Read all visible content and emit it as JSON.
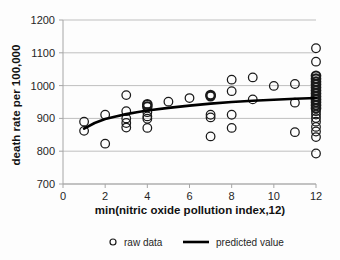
{
  "chart_data": {
    "type": "scatter",
    "title": "",
    "xlabel": "min(nitric oxide pollution index,12)",
    "ylabel": "death rate per 100,000",
    "xlim": [
      0,
      12
    ],
    "ylim": [
      700,
      1200
    ],
    "xticks": [
      0,
      2,
      4,
      6,
      8,
      10,
      12
    ],
    "yticks": [
      700,
      800,
      900,
      1000,
      1100,
      1200
    ],
    "grid": "horizontal",
    "legend_position": "bottom",
    "legend": [
      {
        "label": "raw data",
        "marker": "open-circle"
      },
      {
        "label": "predicted value",
        "marker": "line"
      }
    ],
    "series": [
      {
        "name": "raw data",
        "marker": "open-circle",
        "points": [
          {
            "x": 1,
            "y": 890
          },
          {
            "x": 1,
            "y": 862
          },
          {
            "x": 2,
            "y": 911
          },
          {
            "x": 2,
            "y": 823
          },
          {
            "x": 3,
            "y": 971
          },
          {
            "x": 3,
            "y": 922
          },
          {
            "x": 3,
            "y": 900
          },
          {
            "x": 3,
            "y": 886
          },
          {
            "x": 3,
            "y": 872
          },
          {
            "x": 4,
            "y": 943,
            "emphasis": true
          },
          {
            "x": 4,
            "y": 936,
            "emphasis": true
          },
          {
            "x": 4,
            "y": 919
          },
          {
            "x": 4,
            "y": 906
          },
          {
            "x": 4,
            "y": 899
          },
          {
            "x": 4,
            "y": 871
          },
          {
            "x": 5,
            "y": 951
          },
          {
            "x": 6,
            "y": 962
          },
          {
            "x": 7,
            "y": 971,
            "emphasis": true
          },
          {
            "x": 7,
            "y": 968,
            "emphasis": true
          },
          {
            "x": 7,
            "y": 911
          },
          {
            "x": 7,
            "y": 903
          },
          {
            "x": 7,
            "y": 845
          },
          {
            "x": 8,
            "y": 1018
          },
          {
            "x": 8,
            "y": 983
          },
          {
            "x": 8,
            "y": 911
          },
          {
            "x": 8,
            "y": 871
          },
          {
            "x": 9,
            "y": 1025
          },
          {
            "x": 9,
            "y": 958
          },
          {
            "x": 10,
            "y": 999
          },
          {
            "x": 11,
            "y": 1005
          },
          {
            "x": 11,
            "y": 948
          },
          {
            "x": 11,
            "y": 858
          },
          {
            "x": 12,
            "y": 1114
          },
          {
            "x": 12,
            "y": 1073
          },
          {
            "x": 12,
            "y": 1030,
            "emphasis": true
          },
          {
            "x": 12,
            "y": 1021,
            "emphasis": true
          },
          {
            "x": 12,
            "y": 1012,
            "emphasis": true
          },
          {
            "x": 12,
            "y": 1003,
            "emphasis": true
          },
          {
            "x": 12,
            "y": 994,
            "emphasis": true
          },
          {
            "x": 12,
            "y": 985,
            "emphasis": true
          },
          {
            "x": 12,
            "y": 976,
            "emphasis": true
          },
          {
            "x": 12,
            "y": 967,
            "emphasis": true
          },
          {
            "x": 12,
            "y": 958,
            "emphasis": true
          },
          {
            "x": 12,
            "y": 949,
            "emphasis": true
          },
          {
            "x": 12,
            "y": 940,
            "emphasis": true
          },
          {
            "x": 12,
            "y": 931,
            "emphasis": true
          },
          {
            "x": 12,
            "y": 922
          },
          {
            "x": 12,
            "y": 912
          },
          {
            "x": 12,
            "y": 901
          },
          {
            "x": 12,
            "y": 890
          },
          {
            "x": 12,
            "y": 874
          },
          {
            "x": 12,
            "y": 860
          },
          {
            "x": 12,
            "y": 843
          },
          {
            "x": 12,
            "y": 793
          }
        ]
      },
      {
        "name": "predicted value",
        "marker": "line",
        "points": [
          {
            "x": 1,
            "y": 869
          },
          {
            "x": 1.5,
            "y": 886
          },
          {
            "x": 2,
            "y": 898
          },
          {
            "x": 2.5,
            "y": 906
          },
          {
            "x": 3,
            "y": 913
          },
          {
            "x": 3.5,
            "y": 919
          },
          {
            "x": 4,
            "y": 924
          },
          {
            "x": 5,
            "y": 932
          },
          {
            "x": 6,
            "y": 939
          },
          {
            "x": 7,
            "y": 945
          },
          {
            "x": 8,
            "y": 950
          },
          {
            "x": 9,
            "y": 954
          },
          {
            "x": 10,
            "y": 957
          },
          {
            "x": 11,
            "y": 960
          },
          {
            "x": 12,
            "y": 962
          }
        ]
      }
    ]
  }
}
